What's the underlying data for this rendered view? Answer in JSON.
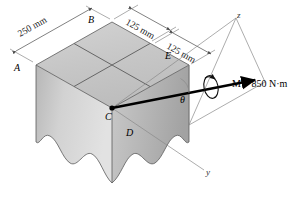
{
  "figure": {
    "type": "engineering-statics-diagram",
    "points": {
      "A": "A",
      "B": "B",
      "C": "C",
      "D": "D",
      "E": "E"
    },
    "dimensions": {
      "left": "250 mm",
      "right_upper": "125 mm",
      "right_lower": "125 mm"
    },
    "axes": {
      "z": "z",
      "y": "y"
    },
    "angle": {
      "theta": "θ"
    },
    "moment": {
      "label": "M = 850 N·m",
      "symbol": "M",
      "value": "850",
      "unit": "N·m"
    },
    "colors": {
      "top_face": "#c9c9c9",
      "left_face": "#d7d7d7",
      "right_face": "#b4b4b4",
      "outline": "#5a5a5a",
      "vector": "#000000",
      "dimension_line": "#4a4a4a",
      "background": "#ffffff"
    }
  }
}
